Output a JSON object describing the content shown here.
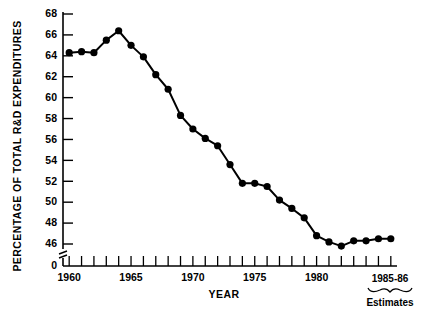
{
  "chart_data": {
    "type": "line",
    "title": "",
    "xlabel": "YEAR",
    "ylabel": "PERCENTAGE OF TOTAL R&D EXPENDITURES",
    "x": [
      1960,
      1961,
      1962,
      1963,
      1964,
      1965,
      1966,
      1967,
      1968,
      1969,
      1970,
      1971,
      1972,
      1973,
      1974,
      1975,
      1976,
      1977,
      1978,
      1979,
      1980,
      1981,
      1982,
      1983,
      1984,
      1985,
      1986
    ],
    "values": [
      64.3,
      64.4,
      64.3,
      65.5,
      66.4,
      65.0,
      63.9,
      62.2,
      60.8,
      58.3,
      57.0,
      56.1,
      55.4,
      53.6,
      51.8,
      51.8,
      51.5,
      50.2,
      49.4,
      48.5,
      46.8,
      46.2,
      45.8,
      46.3,
      46.3,
      46.5,
      46.5
    ],
    "series": [
      {
        "name": "Federal share of total R&D expenditures",
        "values": [
          64.3,
          64.4,
          64.3,
          65.5,
          66.4,
          65.0,
          63.9,
          62.2,
          60.8,
          58.3,
          57.0,
          56.1,
          55.4,
          53.6,
          51.8,
          51.8,
          51.5,
          50.2,
          49.4,
          48.5,
          46.8,
          46.2,
          45.8,
          46.3,
          46.3,
          46.5,
          46.5
        ]
      }
    ],
    "ylim": [
      46,
      68
    ],
    "yticks": [
      46,
      48,
      50,
      52,
      54,
      56,
      58,
      60,
      62,
      64,
      66,
      68
    ],
    "ytick_labels": [
      "46",
      "48",
      "50",
      "52",
      "54",
      "56",
      "58",
      "60",
      "62",
      "64",
      "66",
      "68"
    ],
    "y_origin_label": "0",
    "y_axis_break": true,
    "xlim": [
      1959.5,
      1986.5
    ],
    "xticks": [
      1960,
      1961,
      1962,
      1963,
      1964,
      1965,
      1966,
      1967,
      1968,
      1969,
      1970,
      1971,
      1972,
      1973,
      1974,
      1975,
      1976,
      1977,
      1978,
      1979,
      1980,
      1981,
      1982,
      1983,
      1984,
      1985,
      1986
    ],
    "xtick_labels_shown": [
      {
        "year": 1960,
        "label": "1960"
      },
      {
        "year": 1965,
        "label": "1965"
      },
      {
        "year": 1970,
        "label": "1970"
      },
      {
        "year": 1975,
        "label": "1975"
      },
      {
        "year": 1980,
        "label": "1980"
      },
      {
        "year": 1985.5,
        "label": "1985-86"
      }
    ],
    "grid": false,
    "legend": "none",
    "annotations": [
      {
        "name": "estimates-note",
        "text": "Estimates",
        "applies_to": "1985-86",
        "brace": true
      }
    ],
    "marker": "filled-circle",
    "line_color": "#000000",
    "background_color": "#ffffff"
  },
  "labels": {
    "y_axis_title": "PERCENTAGE OF TOTAL R&D EXPENDITURES",
    "x_axis_title": "YEAR",
    "estimates": "Estimates",
    "estimates_range": "1985-86"
  }
}
